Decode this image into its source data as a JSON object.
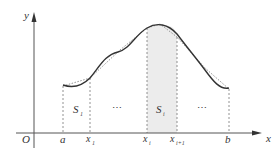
{
  "diagram": {
    "title": "",
    "axes": {
      "x_label": "x",
      "y_label": "y",
      "origin_label": "O"
    },
    "x_ticks": [
      {
        "label": "a",
        "sub": ""
      },
      {
        "label": "x",
        "sub": "1"
      },
      {
        "label": "x",
        "sub": "i"
      },
      {
        "label": "x",
        "sub": "i+1"
      },
      {
        "label": "b",
        "sub": ""
      }
    ],
    "regions": [
      {
        "label": "S",
        "sub": "1",
        "shaded": false
      },
      {
        "label": "⋯",
        "shaded": false
      },
      {
        "label": "S",
        "sub": "i",
        "shaded": true
      },
      {
        "label": "⋯",
        "shaded": false
      }
    ],
    "colors": {
      "curve": "#333333",
      "approx_curve": "#888888",
      "axis": "#555555",
      "shading": "#ececec",
      "guide_lines": "#777777"
    }
  }
}
